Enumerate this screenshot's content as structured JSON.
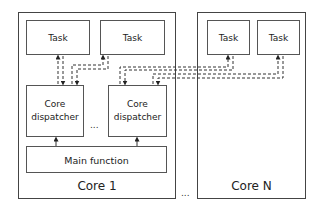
{
  "diagram": {
    "core1": {
      "label": "Core 1",
      "tasks": [
        {
          "label": "Task"
        },
        {
          "label": "Task"
        }
      ],
      "dispatchers": [
        {
          "line1": "Core",
          "line2": "dispatcher"
        },
        {
          "line1": "Core",
          "line2": "dispatcher"
        }
      ],
      "main_function": "Main function",
      "ellipsis": "..."
    },
    "coreN": {
      "label": "Core N",
      "tasks": [
        {
          "label": "Task"
        },
        {
          "label": "Task"
        }
      ]
    },
    "between_cores_ellipsis": "...",
    "colors": {
      "stroke": "#444444",
      "background": "#ffffff"
    }
  }
}
